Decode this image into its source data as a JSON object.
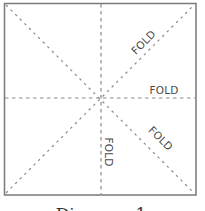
{
  "diagram": {
    "title": "Diagram 1",
    "square": {
      "x": 4,
      "y": 3,
      "size": 192,
      "stroke": "#7a7a7a"
    },
    "fold_line_color": "#8a8a8a",
    "folds": [
      {
        "id": "horizontal",
        "label": "FOLD"
      },
      {
        "id": "vertical",
        "label": "FOLD"
      },
      {
        "id": "diagonal-up",
        "label": "FOLD"
      },
      {
        "id": "diagonal-down",
        "label": "FOLD"
      }
    ]
  }
}
